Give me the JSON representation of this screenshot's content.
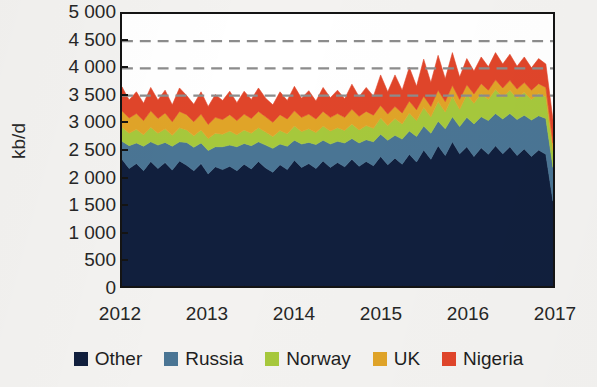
{
  "chart_data": {
    "type": "area",
    "stacked": true,
    "title": "",
    "subtitle": "",
    "xlabel": "",
    "ylabel": "kb/d",
    "ylim": [
      0,
      5000
    ],
    "ytick_step": 500,
    "ytick_labels": [
      "5 000",
      "4 500",
      "4 000",
      "3 500",
      "3 000",
      "2 500",
      "2 000",
      "1 500",
      "1 000",
      "500",
      "0"
    ],
    "ytick_values": [
      5000,
      4500,
      4000,
      3500,
      3000,
      2500,
      2000,
      1500,
      1000,
      500,
      0
    ],
    "xtick_labels": [
      "2012",
      "2013",
      "2014",
      "2015",
      "2016",
      "2017"
    ],
    "xtick_values": [
      2012,
      2013,
      2014,
      2015,
      2016,
      2017
    ],
    "xlim": [
      2012,
      2017
    ],
    "grid": "horizontal-dashed",
    "gridlines": [
      3500,
      4000,
      4500
    ],
    "legend_position": "bottom-center",
    "frame": true,
    "x": [
      2012.0,
      2012.083,
      2012.167,
      2012.25,
      2012.333,
      2012.417,
      2012.5,
      2012.583,
      2012.667,
      2012.75,
      2012.833,
      2012.917,
      2013.0,
      2013.083,
      2013.167,
      2013.25,
      2013.333,
      2013.417,
      2013.5,
      2013.583,
      2013.667,
      2013.75,
      2013.833,
      2013.917,
      2014.0,
      2014.083,
      2014.167,
      2014.25,
      2014.333,
      2014.417,
      2014.5,
      2014.583,
      2014.667,
      2014.75,
      2014.833,
      2014.917,
      2015.0,
      2015.083,
      2015.167,
      2015.25,
      2015.333,
      2015.417,
      2015.5,
      2015.583,
      2015.667,
      2015.75,
      2015.833,
      2015.917,
      2016.0,
      2016.083,
      2016.167,
      2016.25,
      2016.333,
      2016.417,
      2016.5,
      2016.583,
      2016.667,
      2016.75,
      2016.833,
      2016.917,
      2017.0
    ],
    "series": [
      {
        "name": "Other",
        "color": "#111f3d",
        "values": [
          2330,
          2160,
          2250,
          2120,
          2290,
          2160,
          2270,
          2130,
          2300,
          2220,
          2120,
          2250,
          2060,
          2190,
          2140,
          2200,
          2120,
          2240,
          2150,
          2290,
          2170,
          2090,
          2230,
          2140,
          2310,
          2180,
          2250,
          2160,
          2300,
          2180,
          2270,
          2190,
          2330,
          2200,
          2290,
          2210,
          2380,
          2230,
          2350,
          2240,
          2420,
          2280,
          2500,
          2330,
          2580,
          2400,
          2650,
          2430,
          2560,
          2380,
          2540,
          2420,
          2580,
          2430,
          2560,
          2400,
          2520,
          2380,
          2500,
          2420,
          1560
        ]
      },
      {
        "name": "Russia",
        "color": "#4a7594",
        "values": [
          330,
          420,
          380,
          450,
          360,
          430,
          370,
          440,
          350,
          420,
          430,
          380,
          430,
          370,
          420,
          390,
          440,
          380,
          430,
          360,
          420,
          440,
          380,
          430,
          370,
          430,
          390,
          440,
          380,
          430,
          390,
          440,
          380,
          430,
          400,
          440,
          410,
          450,
          420,
          460,
          430,
          470,
          440,
          480,
          450,
          490,
          460,
          500,
          540,
          600,
          570,
          620,
          590,
          640,
          610,
          660,
          620,
          670,
          630,
          660,
          620
        ]
      },
      {
        "name": "Norway",
        "color": "#a6c83c",
        "values": [
          260,
          230,
          250,
          210,
          270,
          220,
          250,
          200,
          260,
          230,
          210,
          240,
          220,
          250,
          230,
          260,
          220,
          250,
          230,
          260,
          240,
          220,
          250,
          230,
          260,
          230,
          250,
          220,
          260,
          240,
          250,
          230,
          270,
          240,
          260,
          250,
          300,
          270,
          310,
          280,
          330,
          290,
          340,
          300,
          360,
          310,
          380,
          320,
          420,
          380,
          430,
          390,
          440,
          400,
          430,
          390,
          420,
          380,
          410,
          400,
          300
        ]
      },
      {
        "name": "UK",
        "color": "#e0a428",
        "values": [
          300,
          280,
          290,
          260,
          300,
          270,
          290,
          250,
          300,
          280,
          260,
          290,
          260,
          290,
          270,
          300,
          260,
          290,
          270,
          300,
          280,
          260,
          290,
          270,
          280,
          260,
          270,
          250,
          270,
          250,
          260,
          240,
          270,
          250,
          260,
          240,
          230,
          210,
          220,
          200,
          220,
          200,
          210,
          190,
          210,
          190,
          200,
          180,
          180,
          170,
          180,
          170,
          180,
          170,
          180,
          170,
          180,
          170,
          180,
          170,
          150
        ]
      },
      {
        "name": "Nigeria",
        "color": "#e0452a",
        "values": [
          440,
          330,
          400,
          320,
          430,
          340,
          420,
          310,
          430,
          350,
          320,
          410,
          330,
          420,
          350,
          430,
          330,
          420,
          350,
          430,
          340,
          320,
          420,
          340,
          450,
          350,
          430,
          330,
          440,
          360,
          430,
          340,
          460,
          360,
          440,
          350,
          560,
          410,
          580,
          420,
          620,
          430,
          680,
          440,
          640,
          420,
          600,
          410,
          480,
          420,
          490,
          430,
          500,
          440,
          480,
          420,
          470,
          410,
          460,
          430,
          420
        ]
      }
    ],
    "totals_note": "stacked total ranges roughly 3 000 - 4 600 kb/d",
    "peak": {
      "x": 2015.5,
      "value": 4600
    }
  },
  "legend": {
    "items": [
      {
        "label": "Other",
        "color": "#111f3d",
        "icon": "square-swatch"
      },
      {
        "label": "Russia",
        "color": "#4a7594",
        "icon": "square-swatch"
      },
      {
        "label": "Norway",
        "color": "#a6c83c",
        "icon": "square-swatch"
      },
      {
        "label": "UK",
        "color": "#e0a428",
        "icon": "square-swatch"
      },
      {
        "label": "Nigeria",
        "color": "#e0452a",
        "icon": "square-swatch"
      }
    ]
  },
  "style": {
    "background": "#f3f2f0",
    "plot_background": "#ffffff",
    "frame_color": "#141414",
    "gridline_color": "#8c8c8c",
    "text_color": "#262626"
  }
}
